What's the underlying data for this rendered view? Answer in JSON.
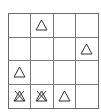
{
  "puzzle": {
    "rows": 4,
    "cols": 4,
    "colors": {
      "line": "#6a6a6a",
      "symbol": "#333333",
      "background": "#ffffff"
    },
    "cells": [
      [
        "empty",
        "triangle",
        "empty",
        "empty"
      ],
      [
        "empty",
        "empty",
        "empty",
        "triangle"
      ],
      [
        "triangle",
        "empty",
        "empty",
        "empty"
      ],
      [
        "crossed-triangle",
        "crossed-triangle",
        "triangle",
        "empty"
      ]
    ]
  }
}
